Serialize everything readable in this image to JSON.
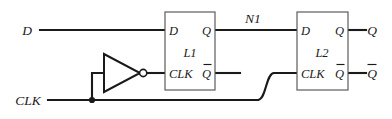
{
  "diagram": {
    "background_color": "#ffffff",
    "wire_color": "#1a1a1a",
    "box_color": "#555555"
  },
  "inputs": {
    "data": {
      "label": "D",
      "name": "data-input"
    },
    "clock": {
      "label": "CLK",
      "name": "clock-input"
    }
  },
  "nets": {
    "internal": {
      "label": "N1",
      "name": "net-n1"
    }
  },
  "blocks": [
    {
      "name": "latch-l1",
      "label": "L1",
      "pins": {
        "d": "D",
        "clk": "CLK",
        "q": "Q",
        "qbar": "Q"
      }
    },
    {
      "name": "latch-l2",
      "label": "L2",
      "pins": {
        "d": "D",
        "clk": "CLK",
        "q": "Q",
        "qbar": "Q"
      }
    }
  ],
  "gates": [
    {
      "name": "clock-inverter",
      "type": "inverter",
      "label": ""
    }
  ],
  "outputs": {
    "q": {
      "label": "Q",
      "name": "q-output"
    },
    "qbar": {
      "label": "Q",
      "name": "qbar-output"
    }
  }
}
